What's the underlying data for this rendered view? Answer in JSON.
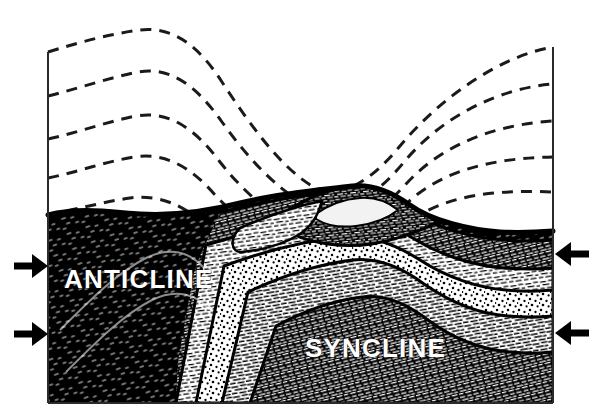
{
  "figure": {
    "type": "geological-cross-section-block-diagram",
    "background_color": "#ffffff",
    "ink_color": "#000000",
    "label_color": "#ffffff"
  },
  "labels": {
    "anticline": "ANTICLINE",
    "syncline": "SYNCLINE",
    "anticline_position": {
      "x": 64,
      "y": 288
    },
    "syncline_position": {
      "x": 305,
      "y": 357
    }
  },
  "frame": {
    "left_x": 48,
    "right_x": 553,
    "top_left_y": 52,
    "top_right_y": 47,
    "bottom_y": 403
  },
  "compression_arrows": {
    "description": "Four bold arrows indicating horizontal compressive stress directed inward",
    "items": [
      {
        "name": "left-upper-arrow",
        "direction": "right",
        "x": 10,
        "y": 266,
        "length": 38
      },
      {
        "name": "left-lower-arrow",
        "direction": "right",
        "x": 10,
        "y": 334,
        "length": 38
      },
      {
        "name": "right-upper-arrow",
        "direction": "left",
        "x": 591,
        "y": 254,
        "length": 38
      },
      {
        "name": "right-lower-arrow",
        "direction": "left",
        "x": 591,
        "y": 333,
        "length": 38
      }
    ]
  },
  "eroded_beds": {
    "description": "Dashed lines showing the projected, eroded-away continuation of the folded strata above the present land surface",
    "line_style": "dashed",
    "count": 5
  },
  "strata": {
    "description": "Rock layers exposed at the erosion surface, each with a distinct engraving texture",
    "layers": [
      {
        "name": "layer-dark-core",
        "texture": "solid-dark",
        "fill": "#000000"
      },
      {
        "name": "layer-dense-hatch",
        "texture": "dense-dash-hatch",
        "fill": "#1a1a1a"
      },
      {
        "name": "layer-medium-hatch",
        "texture": "medium-dash-hatch",
        "fill": "#ffffff"
      },
      {
        "name": "layer-stipple",
        "texture": "stipple-dots",
        "fill": "#ffffff"
      },
      {
        "name": "layer-fine-hatch",
        "texture": "fine-dash-hatch",
        "fill": "#ffffff"
      },
      {
        "name": "layer-crest-dark",
        "texture": "dark-squiggle",
        "fill": "#141414"
      }
    ]
  },
  "surface": {
    "description": "Present-day erosional land surface; a low hill sits over the syncline crest",
    "hill_crest": {
      "x": 365,
      "y": 186
    }
  }
}
